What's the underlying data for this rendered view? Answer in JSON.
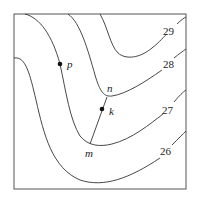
{
  "diagram": {
    "type": "contour-map",
    "contours": [
      {
        "value": "29",
        "label": "29"
      },
      {
        "value": "28",
        "label": "28"
      },
      {
        "value": "27",
        "label": "27"
      },
      {
        "value": "26",
        "label": "26"
      }
    ],
    "points": [
      {
        "id": "p",
        "label": "p",
        "marked": true
      },
      {
        "id": "k",
        "label": "k",
        "marked": true
      },
      {
        "id": "n",
        "label": "n",
        "marked": false
      },
      {
        "id": "m",
        "label": "m",
        "marked": false
      }
    ],
    "segments": [
      {
        "from": "m",
        "to": "n"
      }
    ]
  }
}
